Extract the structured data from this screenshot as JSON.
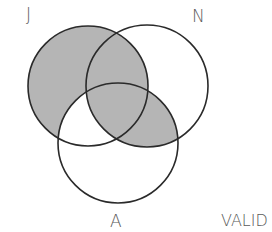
{
  "diagram": {
    "type": "venn-3",
    "sets": [
      {
        "id": "J",
        "label": "J",
        "cx": 88,
        "cy": 86,
        "r": 60
      },
      {
        "id": "N",
        "label": "N",
        "cx": 147,
        "cy": 86,
        "r": 61
      },
      {
        "id": "A",
        "label": "A",
        "cx": 118,
        "cy": 143,
        "r": 60
      }
    ],
    "shaded_regions": [
      "J only",
      "J∩N (not A)",
      "J∩N∩A",
      "N∩A (not J)"
    ],
    "unshaded_regions": [
      "J∩A (not N)",
      "N only",
      "A only"
    ],
    "colors": {
      "shade": "#b5b5b5",
      "stroke": "#2a2a2a",
      "background": "#ffffff",
      "label": "#5a5a5a"
    },
    "verdict": "VALID"
  }
}
